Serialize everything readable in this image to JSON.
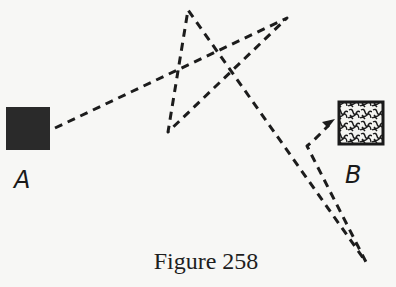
{
  "figure": {
    "caption": "Figure 258",
    "points": {
      "A": {
        "label": "A",
        "fill": "#2a2a2a"
      },
      "B": {
        "label": "B",
        "fill": "textured"
      }
    },
    "path": {
      "style": "dashed",
      "vertices": [
        [
          55,
          128
        ],
        [
          287,
          18
        ],
        [
          168,
          132
        ],
        [
          188,
          10
        ],
        [
          366,
          262
        ],
        [
          307,
          146
        ],
        [
          313,
          141
        ],
        [
          331,
          123
        ]
      ],
      "ends_with": "arrow-to-B"
    }
  }
}
